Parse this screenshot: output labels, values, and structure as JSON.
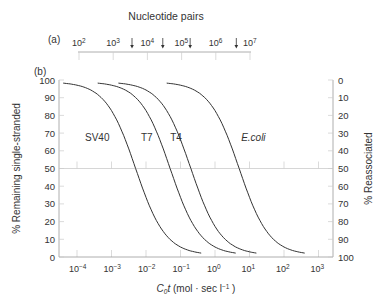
{
  "chart_data": {
    "type": "line",
    "title": "Nucleotide pairs",
    "panels": {
      "a": {
        "label": "(a)",
        "title": "Nucleotide pairs",
        "tick_labels": [
          "10^2",
          "10^3",
          "10^4",
          "10^5",
          "10^6",
          "10^7"
        ],
        "tick_exponents": [
          2,
          3,
          4,
          5,
          6,
          7
        ],
        "arrow_positions_log10": [
          3.55,
          4.45,
          5.25,
          6.6
        ]
      },
      "b": {
        "label": "(b)",
        "xlabel": "C₀t (mol · sec l⁻¹ )",
        "ylabel": "% Remaining single-stranded",
        "ylabel_right": "% Reassociated",
        "xscale": "log",
        "xlim_log10": [
          -4.5,
          3.5
        ],
        "x_tick_exponents": [
          -4,
          -3,
          -2,
          -1,
          0,
          1,
          2,
          3
        ],
        "x_tick_labels": [
          "10⁻⁴",
          "10⁻³",
          "10⁻²",
          "10⁻¹",
          "10⁰",
          "10¹",
          "10²",
          "10³"
        ],
        "ylim": [
          0,
          100
        ],
        "y_ticks": [
          0,
          10,
          20,
          30,
          40,
          50,
          60,
          70,
          80,
          90,
          100
        ],
        "y_ticks_right": [
          100,
          90,
          80,
          70,
          60,
          50,
          40,
          30,
          20,
          10,
          0
        ],
        "gridline_y": 50,
        "series": [
          {
            "name": "SV40",
            "italic": false,
            "cot_half_log10": -2.3,
            "label_pos": [
              -3.0,
              68
            ]
          },
          {
            "name": "T7",
            "italic": false,
            "cot_half_log10": -1.3,
            "label_pos": [
              -1.75,
              68
            ]
          },
          {
            "name": "T4",
            "italic": false,
            "cot_half_log10": -0.7,
            "label_pos": [
              -0.9,
              68
            ]
          },
          {
            "name": "E.coli",
            "italic": true,
            "cot_half_log10": 0.7,
            "label_pos": [
              0.7,
              68
            ]
          }
        ],
        "curve_points_note": "Second-order reassociation: fraction single-stranded = 1/(1 + Cot/Cot½), from ~98% to ~2%"
      }
    }
  },
  "labels": {
    "top_title": "Nucleotide pairs",
    "panel_a": "(a)",
    "panel_b": "(b)",
    "xlabel_main": "C",
    "xlabel_sub": "0",
    "xlabel_italic": "t",
    "xlabel_rest": " (mol · sec l",
    "xlabel_sup": "−1",
    "xlabel_end": " )",
    "ylabel_left": "% Remaining single-stranded",
    "ylabel_right": "% Reassociated"
  },
  "colors": {
    "curve": "#333333",
    "axis": "#999999",
    "grid": "#cccccc",
    "text": "#333333"
  }
}
